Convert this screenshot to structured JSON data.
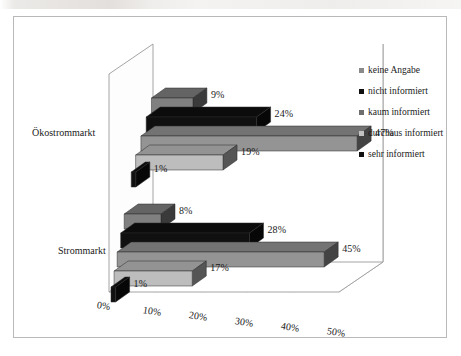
{
  "chart_data": {
    "type": "bar",
    "orientation": "horizontal",
    "title": "",
    "subtitle": "",
    "xlabel": "",
    "ylabel": "",
    "categories": [
      "Ökostrommarkt",
      "Strommarkt"
    ],
    "xlim": [
      0,
      50
    ],
    "xticks": [
      "0%",
      "10%",
      "20%",
      "30%",
      "40%",
      "50%"
    ],
    "xtick_values": [
      0,
      10,
      20,
      30,
      40,
      50
    ],
    "grid": true,
    "legend_position": "right",
    "three_d": true,
    "value_suffix": "%",
    "series": [
      {
        "name": "keine Angabe",
        "color": "#808080",
        "values": [
          9,
          8
        ],
        "labels": [
          "9%",
          "8%"
        ]
      },
      {
        "name": "nicht informiert",
        "color": "#101010",
        "values": [
          24,
          28
        ],
        "labels": [
          "24%",
          "28%"
        ]
      },
      {
        "name": "kaum informiert",
        "color": "#949494",
        "values": [
          47,
          45
        ],
        "labels": [
          "47%",
          "45%"
        ]
      },
      {
        "name": "durchaus informiert",
        "color": "#bdbdbd",
        "values": [
          19,
          17
        ],
        "labels": [
          "19%",
          "17%"
        ]
      },
      {
        "name": "sehr informiert",
        "color": "#101010",
        "values": [
          1,
          1
        ],
        "labels": [
          "1%",
          "1%"
        ]
      }
    ]
  },
  "legend": {
    "items": [
      {
        "label": "keine Angabe",
        "color": "#8a8a8a"
      },
      {
        "label": "nicht informiert",
        "color": "#101010"
      },
      {
        "label": "kaum informiert",
        "color": "#6e6e6e"
      },
      {
        "label": "durchaus informiert",
        "color": "#c2c2c2"
      },
      {
        "label": "sehr informiert",
        "color": "#101010"
      }
    ]
  },
  "axis": {
    "category_labels": [
      "Ökostrommarkt",
      "Strommarkt"
    ],
    "tick_labels": [
      "0%",
      "10%",
      "20%",
      "30%",
      "40%",
      "50%"
    ]
  },
  "data_labels": {
    "oekostrommarkt": [
      "9%",
      "24%",
      "47%",
      "19%",
      "1%"
    ],
    "strommarkt": [
      "8%",
      "28%",
      "45%",
      "17%",
      "1%"
    ]
  },
  "colors": {
    "frame_border": "#b9b9b9",
    "gridline": "#a8a8a8",
    "axis_line": "#9a9a9a",
    "wall": "#ffffff",
    "text": "#1a1a1a"
  }
}
